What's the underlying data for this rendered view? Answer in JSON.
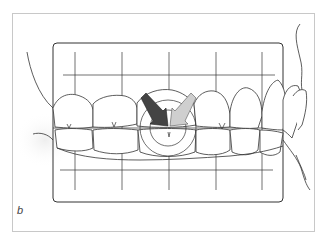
{
  "figure": {
    "panel_label": "b",
    "colors": {
      "background": "#ffffff",
      "frame_border": "#c8c8c8",
      "line": "#333333",
      "dark_arrow": "#444444",
      "light_arrow": "#bdbdbd"
    },
    "grid": {
      "vertical_lines": 5,
      "horizontal_lines": 3
    },
    "arrows": [
      {
        "name": "dark-arrow",
        "direction": "down-right",
        "shade": "dark"
      },
      {
        "name": "light-arrow",
        "direction": "down-left",
        "shade": "light"
      }
    ]
  }
}
